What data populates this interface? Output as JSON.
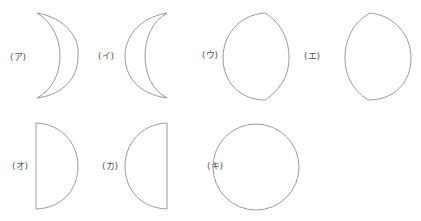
{
  "figure": {
    "stroke_color": "#9a9a9a",
    "label_color": "#555555",
    "items": [
      {
        "label": "(ア)",
        "shape": "crescent-right-bulge"
      },
      {
        "label": "(イ)",
        "shape": "crescent-left-bulge"
      },
      {
        "label": "(ウ)",
        "shape": "gibbous-lens-tips-right"
      },
      {
        "label": "(エ)",
        "shape": "gibbous-lens-tips-left"
      },
      {
        "label": "(オ)",
        "shape": "half-disc-right"
      },
      {
        "label": "(カ)",
        "shape": "half-disc-left"
      },
      {
        "label": "(キ)",
        "shape": "full-circle"
      }
    ]
  }
}
